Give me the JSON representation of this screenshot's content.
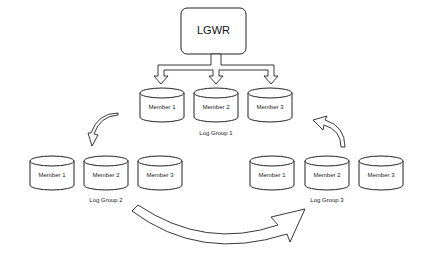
{
  "diagram": {
    "writer": {
      "label": "LGWR"
    },
    "groups": [
      {
        "label": "Log Group 1",
        "members": [
          "Member 1",
          "Member 2",
          "Member 3"
        ]
      },
      {
        "label": "Log Group 2",
        "members": [
          "Member 1",
          "Member 2",
          "Member 3"
        ]
      },
      {
        "label": "Log Group 3",
        "members": [
          "Member 1",
          "Member 2",
          "Member 3"
        ]
      }
    ],
    "colors": {
      "stroke": "#222222",
      "fill": "#ffffff"
    }
  }
}
